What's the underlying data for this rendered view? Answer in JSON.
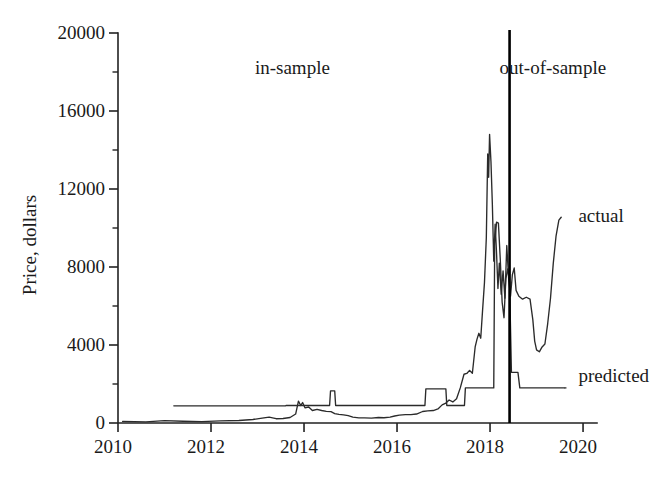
{
  "chart_data": {
    "type": "line",
    "title": "",
    "subtitle": "",
    "xlabel": "",
    "ylabel": "Price, dollars",
    "xlim": [
      2010.0,
      2020.3
    ],
    "ylim": [
      0,
      20000
    ],
    "grid": false,
    "legend_position": "inline-right-labels",
    "x_ticks": [
      2010,
      2012,
      2014,
      2016,
      2018,
      2020
    ],
    "x_tick_labels": [
      "2010",
      "2012",
      "2014",
      "2016",
      "2018",
      "2020"
    ],
    "x_minor_ticks": [
      2011,
      2013,
      2015,
      2017,
      2019
    ],
    "y_ticks": [
      0,
      4000,
      8000,
      12000,
      16000,
      20000
    ],
    "y_tick_labels": [
      "0",
      "4000",
      "8000",
      "12000",
      "16000",
      "20000"
    ],
    "y_minor_ticks": [
      2000,
      6000,
      10000,
      14000,
      18000
    ],
    "annotations": [
      {
        "name": "in-sample",
        "text": "in-sample",
        "x": 2013.75,
        "y": 18200
      },
      {
        "name": "out-of-sample",
        "text": "out-of-sample",
        "x": 2019.35,
        "y": 18200
      },
      {
        "name": "split-divider",
        "text": "",
        "x": 2018.42,
        "y": 20000
      }
    ],
    "split_x": 2018.42,
    "series": [
      {
        "name": "actual",
        "label": "actual",
        "label_x": 2019.9,
        "label_y": 10600,
        "color": "#2b2b2b",
        "points": [
          [
            2010.1,
            80
          ],
          [
            2010.6,
            60
          ],
          [
            2011.0,
            120
          ],
          [
            2011.4,
            90
          ],
          [
            2011.8,
            70
          ],
          [
            2012.2,
            110
          ],
          [
            2012.6,
            130
          ],
          [
            2012.9,
            180
          ],
          [
            2013.1,
            250
          ],
          [
            2013.25,
            300
          ],
          [
            2013.4,
            220
          ],
          [
            2013.55,
            230
          ],
          [
            2013.7,
            280
          ],
          [
            2013.82,
            460
          ],
          [
            2013.88,
            1120
          ],
          [
            2013.93,
            900
          ],
          [
            2013.97,
            1050
          ],
          [
            2014.02,
            780
          ],
          [
            2014.1,
            820
          ],
          [
            2014.18,
            640
          ],
          [
            2014.28,
            700
          ],
          [
            2014.38,
            640
          ],
          [
            2014.48,
            600
          ],
          [
            2014.58,
            580
          ],
          [
            2014.66,
            480
          ],
          [
            2014.75,
            440
          ],
          [
            2014.85,
            420
          ],
          [
            2014.95,
            380
          ],
          [
            2015.05,
            300
          ],
          [
            2015.18,
            260
          ],
          [
            2015.3,
            260
          ],
          [
            2015.45,
            250
          ],
          [
            2015.6,
            280
          ],
          [
            2015.72,
            270
          ],
          [
            2015.85,
            300
          ],
          [
            2015.95,
            360
          ],
          [
            2016.05,
            400
          ],
          [
            2016.18,
            430
          ],
          [
            2016.3,
            430
          ],
          [
            2016.42,
            460
          ],
          [
            2016.55,
            590
          ],
          [
            2016.66,
            620
          ],
          [
            2016.78,
            640
          ],
          [
            2016.88,
            720
          ],
          [
            2016.97,
            930
          ],
          [
            2017.05,
            1020
          ],
          [
            2017.12,
            1180
          ],
          [
            2017.2,
            1080
          ],
          [
            2017.28,
            1240
          ],
          [
            2017.36,
            1800
          ],
          [
            2017.44,
            2500
          ],
          [
            2017.5,
            2540
          ],
          [
            2017.56,
            2700
          ],
          [
            2017.62,
            2550
          ],
          [
            2017.68,
            3900
          ],
          [
            2017.72,
            4300
          ],
          [
            2017.76,
            4600
          ],
          [
            2017.8,
            4350
          ],
          [
            2017.84,
            5800
          ],
          [
            2017.88,
            7200
          ],
          [
            2017.92,
            9500
          ],
          [
            2017.95,
            13800
          ],
          [
            2017.97,
            12600
          ],
          [
            2017.99,
            14800
          ],
          [
            2018.02,
            13400
          ],
          [
            2018.05,
            11200
          ],
          [
            2018.08,
            8300
          ],
          [
            2018.11,
            10200
          ],
          [
            2018.14,
            8700
          ],
          [
            2018.17,
            6900
          ],
          [
            2018.2,
            8200
          ],
          [
            2018.24,
            6600
          ],
          [
            2018.28,
            7800
          ],
          [
            2018.32,
            6400
          ],
          [
            2018.36,
            9100
          ],
          [
            2018.4,
            7400
          ],
          [
            2018.44,
            6500
          ],
          [
            2018.48,
            7600
          ],
          [
            2018.52,
            7950
          ],
          [
            2018.56,
            6800
          ],
          [
            2018.62,
            6500
          ],
          [
            2018.7,
            6350
          ],
          [
            2018.78,
            6450
          ],
          [
            2018.86,
            6350
          ],
          [
            2018.92,
            5300
          ],
          [
            2018.96,
            4200
          ],
          [
            2019.0,
            3750
          ],
          [
            2019.06,
            3650
          ],
          [
            2019.12,
            3900
          ],
          [
            2019.18,
            4050
          ],
          [
            2019.24,
            5100
          ],
          [
            2019.3,
            6400
          ],
          [
            2019.36,
            8200
          ],
          [
            2019.42,
            9600
          ],
          [
            2019.48,
            10400
          ],
          [
            2019.53,
            10550
          ]
        ]
      },
      {
        "name": "predicted",
        "label": "predicted",
        "label_x": 2019.9,
        "label_y": 2400,
        "color": "#2b2b2b",
        "points": [
          [
            2011.2,
            880
          ],
          [
            2013.6,
            880
          ],
          [
            2013.62,
            900
          ],
          [
            2014.55,
            900
          ],
          [
            2014.57,
            1650
          ],
          [
            2014.66,
            1650
          ],
          [
            2014.68,
            900
          ],
          [
            2016.6,
            900
          ],
          [
            2016.62,
            1750
          ],
          [
            2017.05,
            1750
          ],
          [
            2017.07,
            900
          ],
          [
            2017.45,
            900
          ],
          [
            2017.47,
            1800
          ],
          [
            2018.08,
            1800
          ],
          [
            2018.1,
            9200
          ],
          [
            2018.14,
            10300
          ],
          [
            2018.18,
            10250
          ],
          [
            2018.22,
            8400
          ],
          [
            2018.26,
            6200
          ],
          [
            2018.3,
            5400
          ],
          [
            2018.34,
            7400
          ],
          [
            2018.38,
            7900
          ],
          [
            2018.42,
            7200
          ],
          [
            2018.46,
            2600
          ],
          [
            2018.6,
            2600
          ],
          [
            2018.64,
            1800
          ],
          [
            2019.6,
            1800
          ]
        ]
      }
    ]
  },
  "labels": {
    "y_axis_title": "Price, dollars"
  }
}
